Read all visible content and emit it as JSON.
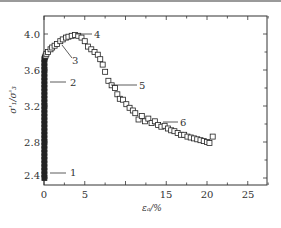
{
  "chart_data": {
    "type": "scatter",
    "title": "",
    "xlabel": "ε_a/%",
    "ylabel": "σ'1/σ'3",
    "xlim": [
      0,
      27.5
    ],
    "ylim": [
      2.28,
      4.2
    ],
    "xticks": [
      0,
      5,
      15,
      20,
      25
    ],
    "xtick_labels": [
      "0",
      "5",
      "15",
      "20",
      "25"
    ],
    "yticks": [
      2.4,
      2.8,
      3.2,
      3.6,
      4.0
    ],
    "ytick_labels": [
      "2.4",
      "2.8",
      "3.2",
      "3.6",
      "4.0"
    ],
    "grid": false,
    "marker": "open-square",
    "series": [
      {
        "name": "σ'1/σ'3 vs ε_a",
        "x": [
          0.05,
          0.05,
          0.05,
          0.05,
          0.05,
          0.05,
          0.05,
          0.05,
          0.05,
          0.05,
          0.05,
          0.05,
          0.05,
          0.05,
          0.05,
          0.05,
          0.05,
          0.05,
          0.05,
          0.05,
          0.05,
          0.05,
          0.05,
          0.05,
          0.05,
          0.05,
          0.05,
          0.05,
          0.05,
          0.05,
          0.05,
          0.05,
          0.05,
          0.05,
          0.1,
          0.2,
          0.3,
          0.5,
          0.8,
          1.0,
          1.3,
          1.6,
          2.0,
          2.3,
          2.7,
          3.0,
          3.4,
          3.8,
          4.2,
          4.6,
          5.0,
          5.4,
          5.8,
          6.2,
          6.6,
          6.9,
          7.2,
          7.5,
          7.9,
          8.3,
          8.7,
          9.0,
          9.3,
          9.7,
          10.1,
          10.5,
          10.9,
          11.2,
          11.6,
          12.0,
          12.4,
          12.8,
          13.2,
          13.6,
          14.0,
          14.4,
          14.8,
          15.2,
          15.6,
          16.0,
          16.4,
          16.8,
          17.2,
          17.6,
          18.0,
          18.4,
          18.8,
          19.2,
          19.6,
          20.0,
          20.3,
          20.7
        ],
        "y": [
          2.4,
          2.44,
          2.48,
          2.52,
          2.56,
          2.6,
          2.64,
          2.68,
          2.72,
          2.76,
          2.8,
          2.84,
          2.88,
          2.92,
          2.96,
          3.0,
          3.04,
          3.08,
          3.12,
          3.16,
          3.2,
          3.24,
          3.28,
          3.32,
          3.36,
          3.4,
          3.44,
          3.48,
          3.52,
          3.56,
          3.6,
          3.64,
          3.68,
          3.72,
          3.74,
          3.76,
          3.78,
          3.8,
          3.83,
          3.85,
          3.87,
          3.89,
          3.92,
          3.94,
          3.96,
          3.97,
          3.98,
          3.99,
          3.98,
          3.96,
          3.92,
          3.86,
          3.83,
          3.8,
          3.77,
          3.72,
          3.66,
          3.58,
          3.48,
          3.43,
          3.4,
          3.33,
          3.28,
          3.27,
          3.22,
          3.18,
          3.15,
          3.12,
          3.05,
          3.09,
          3.03,
          3.06,
          3.01,
          3.03,
          2.99,
          2.97,
          2.98,
          2.95,
          2.93,
          2.92,
          2.9,
          2.88,
          2.88,
          2.86,
          2.85,
          2.84,
          2.83,
          2.82,
          2.81,
          2.8,
          2.79,
          2.86
        ]
      }
    ],
    "annotations": [
      {
        "label": "1",
        "x": 0.05,
        "y": 2.42
      },
      {
        "label": "2",
        "x": 0.05,
        "y": 3.52
      },
      {
        "label": "3",
        "x": 2.3,
        "y": 3.9
      },
      {
        "label": "4",
        "x": 3.8,
        "y": 3.99
      },
      {
        "label": "5",
        "x": 8.0,
        "y": 3.43
      },
      {
        "label": "6",
        "x": 14.4,
        "y": 2.99
      }
    ],
    "legend": null
  },
  "labels": {
    "ylabel": "σ'₁/σ'₃",
    "xlabel": "εₐ/%",
    "x0": "0",
    "x5": "5",
    "x15": "15",
    "x20": "20",
    "x25": "25",
    "y24": "2.4",
    "y28": "2.8",
    "y32": "3.2",
    "y36": "3.6",
    "y40": "4.0",
    "a1": "1",
    "a2": "2",
    "a3": "3",
    "a4": "4",
    "a5": "5",
    "a6": "6"
  }
}
